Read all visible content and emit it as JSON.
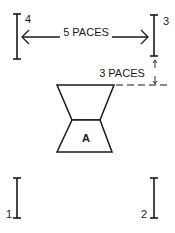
{
  "diagram": {
    "markers": [
      {
        "id": "1",
        "label": "1"
      },
      {
        "id": "2",
        "label": "2"
      },
      {
        "id": "3",
        "label": "3"
      },
      {
        "id": "4",
        "label": "4"
      }
    ],
    "horizontal_distance": {
      "label": "5 PACES"
    },
    "vertical_distance": {
      "label": "3 PACES"
    },
    "position": {
      "label": "A"
    },
    "colors": {
      "ink": "#1a1a1a",
      "background": "#ffffff"
    }
  }
}
